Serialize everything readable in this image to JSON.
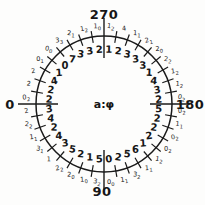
{
  "figure": {
    "center_label": "a:φ",
    "cardinal_labels": {
      "left": "0",
      "bottom": "90",
      "right": "180",
      "top": "270"
    },
    "ink_color": "#1a1a1a",
    "paper_color": "#fdfdfc"
  },
  "chart_data": {
    "type": "polar",
    "title": "",
    "orientation": "angle labels: 0 at left, 90 at bottom, 180 at right, 270 at top; angles increase counterclockwise on screen; tick marks every 10 degrees; long axis lines at 0/90/180/270",
    "center_label": "a:φ",
    "rings": [
      "inner bold counts",
      "outer small counts (second digit subscripted)"
    ],
    "sector_centers_deg": [
      5,
      15,
      25,
      35,
      45,
      55,
      65,
      75,
      85,
      95,
      105,
      115,
      125,
      135,
      145,
      155,
      165,
      175,
      185,
      195,
      205,
      215,
      225,
      235,
      245,
      255,
      265,
      275,
      285,
      295,
      305,
      315,
      325,
      335,
      345,
      355
    ],
    "series": [
      {
        "name": "inner-counts",
        "values": [
          3,
          4,
          2,
          4,
          3,
          5,
          2,
          1,
          5,
          0,
          2,
          5,
          6,
          1,
          2,
          2,
          2,
          5,
          2,
          3,
          4,
          1,
          3,
          3,
          3,
          2,
          1,
          2,
          3,
          3,
          7,
          0,
          1,
          4,
          2,
          2
        ]
      },
      {
        "name": "outer-counts",
        "values": [
          "2",
          "22",
          "11",
          "31",
          "1",
          "22",
          "20",
          "10",
          "32",
          "00",
          "11",
          "32",
          "11",
          "12",
          "02",
          "02",
          "11",
          "02",
          "02",
          "12",
          "12",
          "22",
          "20",
          "21",
          "11",
          "4",
          "12",
          "10",
          "12",
          "21",
          "33",
          "00",
          "01",
          "2",
          "2",
          "02"
        ]
      }
    ]
  }
}
